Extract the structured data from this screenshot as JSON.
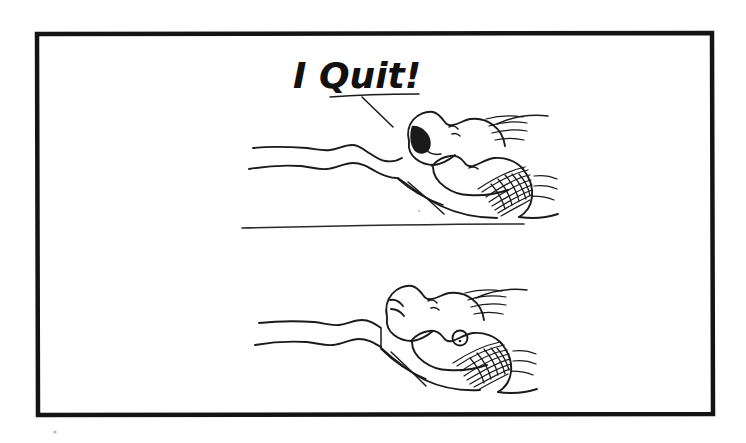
{
  "artwork": {
    "kind": "hand-drawn-cartoon",
    "title": "I Quit!",
    "caption_text": "I Quit!",
    "panel_count": 2,
    "background_color": "#ffffff",
    "ink_color": "#1a1a1a",
    "frame_color": "#141414",
    "frame": {
      "x": 36,
      "y": 33,
      "width": 677,
      "height": 382
    },
    "panels": [
      {
        "name": "top-panel",
        "description": "Two people lying in bed under a blanket; the near figure's mouth is open, shouting.",
        "has_caption": true,
        "caption": "I Quit!"
      },
      {
        "name": "bottom-panel",
        "description": "The same two people lying in bed; mouths closed, the far figure's eye is open.",
        "has_caption": false,
        "caption": ""
      }
    ],
    "divider": {
      "name": "panel-divider",
      "x1": 242,
      "y1": 228,
      "x2": 524,
      "y2": 224
    },
    "caption_position": {
      "x": 293,
      "y": 88,
      "font_size": 36
    },
    "speech_pointer": {
      "underline_x1": 330,
      "underline_y1": 96,
      "underline_x2": 418,
      "underline_y2": 94,
      "leader_x1": 360,
      "leader_y1": 96,
      "leader_x2": 392,
      "leader_y2": 125
    }
  }
}
